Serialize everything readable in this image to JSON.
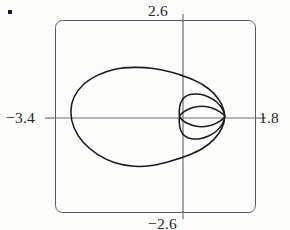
{
  "figure": {
    "name": "graphing-calculator-polar-plot",
    "bullet": "▪"
  },
  "labels": {
    "ymax": "2.6",
    "ymin": "−2.6",
    "xmin": "−3.4",
    "xmax": "1.8"
  },
  "colors": {
    "background": "#fdfdfc",
    "curve": "#1a1a1a",
    "axis": "#6b6b6b",
    "frame": "#5a5a5a",
    "text": "#242424"
  },
  "chart_data": {
    "type": "line",
    "title": "",
    "subtitle": "",
    "xlabel": "",
    "ylabel": "",
    "xlim": [
      -3.4,
      1.8
    ],
    "ylim": [
      -2.6,
      2.6
    ],
    "xticks": [
      -3.4,
      1.8
    ],
    "yticks": [
      -2.6,
      2.6
    ],
    "xtick_labels": [
      "−3.4",
      "1.8"
    ],
    "ytick_labels": [
      "−2.6",
      "2.6"
    ],
    "grid": false,
    "legend": null,
    "legend_position": "none",
    "annotations": [],
    "coordinate_system": "polar",
    "axes_visible": true,
    "frame_visible": true,
    "series": [
      {
        "name": "outer-limacon-loop",
        "description": "large outer loop passing through the node on the positive x-axis",
        "closed": true,
        "points": [
          [
            1.0,
            0.0
          ],
          [
            0.92,
            0.33
          ],
          [
            0.72,
            0.62
          ],
          [
            0.43,
            0.86
          ],
          [
            0.05,
            1.05
          ],
          [
            -0.38,
            1.2
          ],
          [
            -0.85,
            1.3
          ],
          [
            -1.35,
            1.33
          ],
          [
            -1.85,
            1.28
          ],
          [
            -2.3,
            1.12
          ],
          [
            -2.68,
            0.86
          ],
          [
            -2.92,
            0.52
          ],
          [
            -3.0,
            0.13
          ],
          [
            -2.92,
            -0.3
          ],
          [
            -2.68,
            -0.7
          ],
          [
            -2.3,
            -1.03
          ],
          [
            -1.85,
            -1.25
          ],
          [
            -1.35,
            -1.35
          ],
          [
            -0.85,
            -1.32
          ],
          [
            -0.38,
            -1.2
          ],
          [
            0.05,
            -1.05
          ],
          [
            0.43,
            -0.86
          ],
          [
            0.72,
            -0.62
          ],
          [
            0.92,
            -0.33
          ],
          [
            1.0,
            0.0
          ]
        ]
      },
      {
        "name": "inner-loop-large",
        "description": "larger inner loop from node on x-axis to the origin region",
        "closed": true,
        "points": [
          [
            1.0,
            0.0
          ],
          [
            0.93,
            0.22
          ],
          [
            0.78,
            0.4
          ],
          [
            0.58,
            0.53
          ],
          [
            0.36,
            0.6
          ],
          [
            0.13,
            0.6
          ],
          [
            -0.05,
            0.52
          ],
          [
            -0.15,
            0.36
          ],
          [
            -0.18,
            0.18
          ],
          [
            -0.18,
            0.0
          ],
          [
            -0.18,
            -0.18
          ],
          [
            -0.15,
            -0.36
          ],
          [
            -0.05,
            -0.52
          ],
          [
            0.13,
            -0.6
          ],
          [
            0.36,
            -0.6
          ],
          [
            0.58,
            -0.53
          ],
          [
            0.78,
            -0.4
          ],
          [
            0.93,
            -0.22
          ],
          [
            1.0,
            0.0
          ]
        ]
      },
      {
        "name": "inner-loop-small",
        "description": "small lens-shaped inner loop between the two node points",
        "closed": true,
        "points": [
          [
            1.0,
            0.0
          ],
          [
            0.85,
            0.14
          ],
          [
            0.65,
            0.24
          ],
          [
            0.43,
            0.28
          ],
          [
            0.2,
            0.25
          ],
          [
            0.0,
            0.17
          ],
          [
            -0.13,
            0.07
          ],
          [
            -0.17,
            0.0
          ],
          [
            -0.13,
            -0.07
          ],
          [
            0.0,
            -0.17
          ],
          [
            0.2,
            -0.25
          ],
          [
            0.43,
            -0.28
          ],
          [
            0.65,
            -0.24
          ],
          [
            0.85,
            -0.14
          ],
          [
            1.0,
            0.0
          ]
        ]
      }
    ]
  }
}
